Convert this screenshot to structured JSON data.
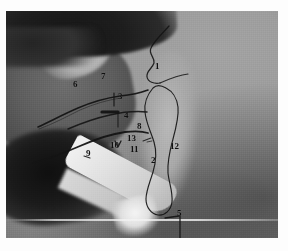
{
  "image": {
    "kind": "clinical-photograph",
    "view": "lateral head and neck, patient supine, right side of neck exposed",
    "modality": "grayscale photograph with hand-drawn surface markings",
    "frame": {
      "border_color": "#ffffff",
      "photo_bg": "#8d8d8d"
    },
    "palette": {
      "hair_dark": "#1a1a1a",
      "face_mid_gray": "#5e5e5e",
      "skin_light_gray": "#a8a8a8",
      "drape_white": "#f2f2f2",
      "ink_black": "#101010",
      "highlight": "#c9c9c9"
    },
    "caption": ""
  },
  "annotations": {
    "style": {
      "ink": "#101010",
      "font_weight": "bold"
    },
    "labels": [
      {
        "id": "1",
        "text": "1",
        "x": 155,
        "y": 62,
        "role": "label-1"
      },
      {
        "id": "2",
        "text": "2",
        "x": 151,
        "y": 156,
        "role": "label-2"
      },
      {
        "id": "3",
        "text": "3",
        "x": 118,
        "y": 92,
        "role": "label-3"
      },
      {
        "id": "4",
        "text": "4",
        "x": 124,
        "y": 111,
        "role": "label-4"
      },
      {
        "id": "5",
        "text": "5",
        "x": 177,
        "y": 209,
        "role": "label-5"
      },
      {
        "id": "6",
        "text": "6",
        "x": 73,
        "y": 80,
        "role": "label-6"
      },
      {
        "id": "7",
        "text": "7",
        "x": 101,
        "y": 72,
        "role": "label-7"
      },
      {
        "id": "8",
        "text": "8",
        "x": 137,
        "y": 122,
        "role": "label-8"
      },
      {
        "id": "9",
        "text": "9",
        "x": 86,
        "y": 149,
        "role": "label-9"
      },
      {
        "id": "10",
        "text": "10",
        "x": 110,
        "y": 141,
        "role": "label-10"
      },
      {
        "id": "11",
        "text": "11",
        "x": 130,
        "y": 145,
        "role": "label-11"
      },
      {
        "id": "12",
        "text": "12",
        "x": 170,
        "y": 142,
        "role": "label-12"
      },
      {
        "id": "13",
        "text": "13",
        "x": 127,
        "y": 134,
        "role": "label-13"
      }
    ],
    "marked_lines": [
      {
        "name": "mandible-border-line",
        "desc": "upper long diagonal ink line from jaw angle forward"
      },
      {
        "name": "mid-neck-line",
        "desc": "second diagonal ink line below the first"
      },
      {
        "name": "lower-neck-line",
        "desc": "third, longest diagonal ink line toward clavicle"
      },
      {
        "name": "short-tick-3",
        "desc": "short vertical tick at label 3"
      },
      {
        "name": "short-tick-4",
        "desc": "short vertical tick at label 4"
      },
      {
        "name": "thick-dash-4",
        "desc": "short thick horizontal dash left of label 4"
      },
      {
        "name": "arrow-10",
        "desc": "small downward arrowhead above label 10"
      },
      {
        "name": "tick-13",
        "desc": "small tick right of label 13"
      },
      {
        "name": "leader-5",
        "desc": "short leader dash plus vertical line at label 5"
      },
      {
        "name": "muscle-outline",
        "desc": "long vertical closed outline of sternocleidomastoid running down the neck"
      },
      {
        "name": "upper-hook-1",
        "desc": "hooked line at label 1 over the jaw / mastoid"
      },
      {
        "name": "branch-line-1",
        "desc": "short line branching right from the hook at label 1"
      }
    ]
  }
}
